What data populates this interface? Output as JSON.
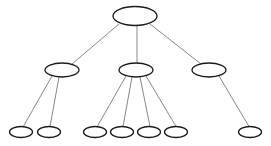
{
  "diagram": {
    "type": "tree",
    "width": 271,
    "height": 146,
    "colors": {
      "background": "#ffffff",
      "node_stroke": "#1a1a1a",
      "node_fill": "#ffffff",
      "edge_stroke": "#7a7a7a"
    },
    "nodes": [
      {
        "id": "root",
        "level": 0,
        "cx": 135,
        "cy": 16,
        "rx": 22,
        "ry": 9.5
      },
      {
        "id": "mid-left",
        "level": 1,
        "cx": 62,
        "cy": 70,
        "rx": 17,
        "ry": 7
      },
      {
        "id": "mid-center",
        "level": 1,
        "cx": 136,
        "cy": 70,
        "rx": 17,
        "ry": 7
      },
      {
        "id": "mid-right",
        "level": 1,
        "cx": 209,
        "cy": 70,
        "rx": 17,
        "ry": 7
      },
      {
        "id": "leaf-1",
        "level": 2,
        "cx": 21,
        "cy": 132,
        "rx": 11.5,
        "ry": 5.5
      },
      {
        "id": "leaf-2",
        "level": 2,
        "cx": 49,
        "cy": 132,
        "rx": 11.5,
        "ry": 5.5
      },
      {
        "id": "leaf-3",
        "level": 2,
        "cx": 95,
        "cy": 132,
        "rx": 11.5,
        "ry": 5.5
      },
      {
        "id": "leaf-4",
        "level": 2,
        "cx": 122,
        "cy": 132,
        "rx": 11.5,
        "ry": 5.5
      },
      {
        "id": "leaf-5",
        "level": 2,
        "cx": 149,
        "cy": 132,
        "rx": 11.5,
        "ry": 5.5
      },
      {
        "id": "leaf-6",
        "level": 2,
        "cx": 176,
        "cy": 132,
        "rx": 11.5,
        "ry": 5.5
      },
      {
        "id": "leaf-7",
        "level": 2,
        "cx": 250,
        "cy": 132,
        "rx": 11.5,
        "ry": 5.5
      }
    ],
    "edges": [
      {
        "from": "root",
        "to": "mid-left",
        "x1": 119,
        "y1": 24,
        "x2": 72,
        "y2": 64
      },
      {
        "from": "root",
        "to": "mid-center",
        "x1": 137,
        "y1": 25.5,
        "x2": 137,
        "y2": 63
      },
      {
        "from": "root",
        "to": "mid-right",
        "x1": 150,
        "y1": 24,
        "x2": 201,
        "y2": 64
      },
      {
        "from": "mid-left",
        "to": "leaf-1",
        "x1": 52,
        "y1": 76,
        "x2": 23,
        "y2": 127
      },
      {
        "from": "mid-left",
        "to": "leaf-2",
        "x1": 59,
        "y1": 77,
        "x2": 50,
        "y2": 126.5
      },
      {
        "from": "mid-center",
        "to": "leaf-3",
        "x1": 126,
        "y1": 76,
        "x2": 97,
        "y2": 127
      },
      {
        "from": "mid-center",
        "to": "leaf-4",
        "x1": 132,
        "y1": 77,
        "x2": 123,
        "y2": 126.5
      },
      {
        "from": "mid-center",
        "to": "leaf-5",
        "x1": 140,
        "y1": 77,
        "x2": 150,
        "y2": 126.5
      },
      {
        "from": "mid-center",
        "to": "leaf-6",
        "x1": 146,
        "y1": 76,
        "x2": 176,
        "y2": 126.5
      },
      {
        "from": "mid-right",
        "to": "leaf-7",
        "x1": 219,
        "y1": 76,
        "x2": 249,
        "y2": 126.5
      }
    ]
  }
}
